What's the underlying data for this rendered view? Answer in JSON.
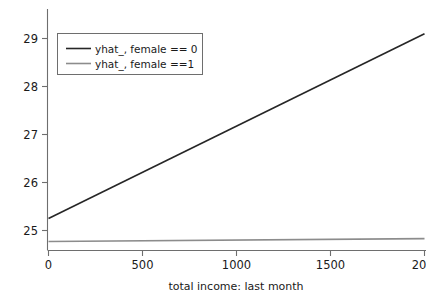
{
  "chart_data": {
    "type": "line",
    "title": "",
    "subtitle": "",
    "xlabel": "total income: last month",
    "ylabel": "",
    "xlim": [
      0,
      2000
    ],
    "ylim": [
      24.6,
      29.35
    ],
    "grid": false,
    "legend_position": "top-left",
    "x_ticks": [
      {
        "value": 0,
        "label": "0"
      },
      {
        "value": 500,
        "label": "500"
      },
      {
        "value": 1000,
        "label": "1000"
      },
      {
        "value": 1500,
        "label": "1500"
      },
      {
        "value": 2000,
        "label": "20"
      }
    ],
    "y_ticks": [
      {
        "value": 25,
        "label": "25"
      },
      {
        "value": 26,
        "label": "26"
      },
      {
        "value": 27,
        "label": "27"
      },
      {
        "value": 28,
        "label": "28"
      },
      {
        "value": 29,
        "label": "29"
      }
    ],
    "series": [
      {
        "name": "yhat_, female == 0",
        "color": "#262626",
        "width": 1.6,
        "x": [
          0,
          2000
        ],
        "values": [
          25.25,
          29.1
        ]
      },
      {
        "name": "yhat_, female ==1",
        "color": "#8c8c8c",
        "width": 1.6,
        "x": [
          0,
          2000
        ],
        "values": [
          24.77,
          24.83
        ]
      }
    ],
    "legend": [
      {
        "label": "yhat_, female == 0",
        "color": "#262626"
      },
      {
        "label": "yhat_, female ==1",
        "color": "#8c8c8c"
      }
    ]
  },
  "axes": {
    "xlabel": "total income: last month"
  },
  "colors": {
    "background": "#ffffff",
    "axis": "#6e6e6e",
    "text": "#1a1a1a",
    "series_dark": "#262626",
    "series_gray": "#8c8c8c"
  }
}
